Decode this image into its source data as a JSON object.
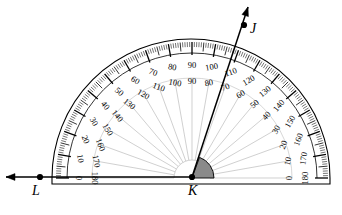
{
  "figure": {
    "kind": "protractor-angle-diagram",
    "background_color": "#ffffff",
    "ink_color": "#000000",
    "shade_color": "#8a8a8a",
    "grid_color": "#bcbcbc"
  },
  "points": [
    {
      "id": "K",
      "label": "K",
      "role": "vertex",
      "x": 192,
      "y": 177,
      "label_x": 188,
      "label_y": 184,
      "dot": true
    },
    {
      "id": "L",
      "label": "L",
      "role": "ray-point-left",
      "x": 40,
      "y": 177,
      "label_x": 32,
      "label_y": 184,
      "dot": true
    },
    {
      "id": "J",
      "label": "J",
      "role": "ray-point-upper",
      "x": 244,
      "y": 25,
      "label_x": 250,
      "label_y": 22,
      "dot": true
    }
  ],
  "rays": [
    {
      "id": "ray-KL",
      "from": "K",
      "through": "L",
      "arrow_tip_x": 6,
      "arrow_tip_y": 177,
      "direction_deg": 180
    },
    {
      "id": "ray-KJ",
      "from": "K",
      "through": "J",
      "arrow_tip_x": 248,
      "arrow_tip_y": 7,
      "direction_deg": 110
    }
  ],
  "angle": {
    "name": "JKL",
    "vertex": "K",
    "measure_degrees": 110,
    "shaded": true,
    "shade_from_deg": 110,
    "shade_to_deg": 180,
    "shade_radius": 22
  },
  "protractor": {
    "center_x": 192,
    "center_y": 178,
    "outer_radius": 138,
    "body_left": 52,
    "body_right": 330,
    "baseline_y": 178,
    "base_bottom_y": 184,
    "rim_band_inner_radius": 125,
    "outer_number_radius": 113,
    "inner_number_radius": 97,
    "spoke_inner_radius": 18,
    "spoke_outer_radius": 100,
    "tick_major_every": 10,
    "tick_minor_every": 1,
    "outer_scale": {
      "name": "outer-scale",
      "zero_side": "left",
      "labels": [
        0,
        10,
        20,
        30,
        40,
        50,
        60,
        70,
        80,
        90,
        100,
        110,
        120,
        130,
        140,
        150,
        160,
        170,
        180
      ]
    },
    "inner_scale": {
      "name": "inner-scale",
      "zero_side": "right",
      "labels": [
        180,
        170,
        160,
        150,
        140,
        130,
        120,
        110,
        100,
        90,
        80,
        70,
        60,
        50,
        40,
        30,
        20,
        10,
        0
      ]
    }
  }
}
